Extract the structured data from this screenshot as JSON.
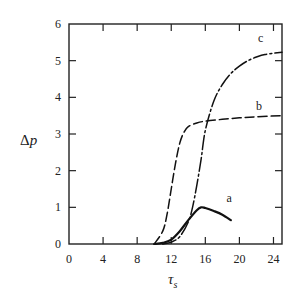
{
  "chart_data": {
    "type": "line",
    "title": "",
    "xlabel": "τs",
    "xlabel_main": "τ",
    "xlabel_sub": "s",
    "ylabel": "Δp",
    "ylabel_delta": "Δ",
    "ylabel_var": "p",
    "xlim": [
      0,
      25
    ],
    "ylim": [
      0,
      6
    ],
    "xticks": [
      0,
      4,
      8,
      12,
      16,
      20,
      24
    ],
    "yticks": [
      0,
      1,
      2,
      3,
      4,
      5,
      6
    ],
    "grid": false,
    "legend": "inline curve labels",
    "series": [
      {
        "name": "a",
        "style": "solid-bold",
        "x": [
          10,
          11,
          12,
          13,
          14,
          15,
          15.5,
          16,
          17,
          18,
          19
        ],
        "y": [
          0,
          0.03,
          0.12,
          0.35,
          0.65,
          0.92,
          1.0,
          0.98,
          0.9,
          0.8,
          0.65
        ],
        "label_pos": [
          18.8,
          1.15
        ]
      },
      {
        "name": "b",
        "style": "dashed",
        "x": [
          10,
          11,
          11.5,
          12,
          12.5,
          13,
          13.5,
          14,
          15,
          16,
          18,
          20,
          22,
          25
        ],
        "y": [
          0,
          0.35,
          0.8,
          1.5,
          2.2,
          2.75,
          3.05,
          3.2,
          3.3,
          3.35,
          3.4,
          3.44,
          3.47,
          3.5
        ],
        "label_pos": [
          22.3,
          3.65
        ]
      },
      {
        "name": "c",
        "style": "dash-dot",
        "x": [
          11,
          12,
          13,
          14,
          14.5,
          15,
          15.5,
          16,
          17,
          18,
          19,
          20,
          21,
          22,
          23,
          25
        ],
        "y": [
          0,
          0.05,
          0.2,
          0.6,
          1.0,
          1.6,
          2.3,
          3.1,
          3.9,
          4.35,
          4.65,
          4.85,
          5.0,
          5.1,
          5.17,
          5.23
        ],
        "label_pos": [
          22.5,
          5.5
        ]
      }
    ]
  }
}
